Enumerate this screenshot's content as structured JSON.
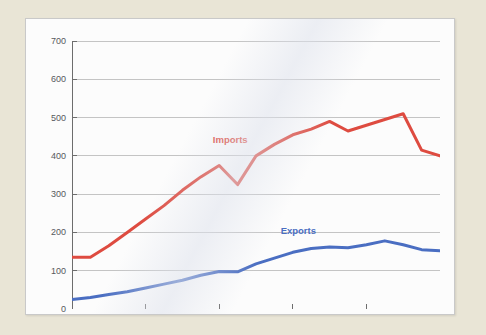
{
  "chart_data": {
    "type": "line",
    "title": "",
    "xlabel": "",
    "ylabel": "",
    "xlim": [
      2000,
      2020
    ],
    "ylim": [
      0,
      700
    ],
    "yticks": [
      0,
      100,
      200,
      300,
      400,
      500,
      600,
      700
    ],
    "xticks": [
      2000,
      2004,
      2008,
      2012,
      2016,
      2020
    ],
    "grid": true,
    "legend_position": "inline-annotations",
    "x": [
      2000,
      2001,
      2002,
      2003,
      2004,
      2005,
      2006,
      2007,
      2008,
      2009,
      2010,
      2011,
      2012,
      2013,
      2014,
      2015,
      2016,
      2017,
      2018,
      2019,
      2020
    ],
    "series": [
      {
        "name": "Imports",
        "color": "#de4b40",
        "values": [
          135,
          135,
          165,
          200,
          235,
          270,
          310,
          345,
          375,
          325,
          400,
          430,
          455,
          470,
          490,
          465,
          480,
          495,
          510,
          415,
          400
        ],
        "label_x": 2008.6,
        "label_y": 445
      },
      {
        "name": "Exports",
        "color": "#4a6ec2",
        "values": [
          25,
          30,
          38,
          45,
          55,
          65,
          75,
          88,
          98,
          97,
          118,
          133,
          148,
          158,
          162,
          160,
          168,
          178,
          168,
          155,
          152
        ],
        "label_x": 2012.3,
        "label_y": 207
      }
    ]
  },
  "axis": {
    "ytick_labels": [
      "0",
      "100",
      "200",
      "300",
      "400",
      "500",
      "600",
      "700"
    ],
    "xtick_labels": [
      "2000",
      "2004",
      "2008",
      "2012",
      "2016",
      "2020"
    ]
  }
}
